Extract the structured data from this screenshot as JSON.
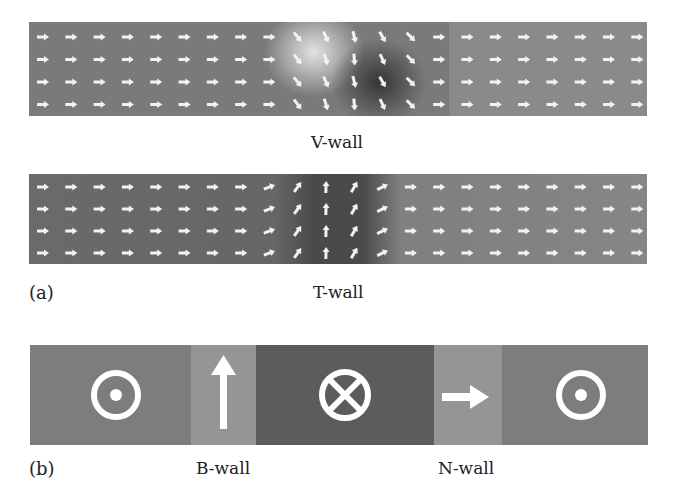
{
  "figure": {
    "panel_a": {
      "label": "(a)",
      "v_wall": {
        "caption": "V-wall",
        "background": "#7a7a7a",
        "rows": 4,
        "cols": 22
      },
      "t_wall": {
        "caption": "T-wall",
        "background": "#6c6c6c",
        "rows": 4,
        "cols": 22
      }
    },
    "panel_b": {
      "label": "(b)",
      "segments": [
        {
          "name": "domain-out",
          "symbol": "dot-circle",
          "color": "#7d7d7d"
        },
        {
          "name": "b-wall",
          "symbol": "arrow-up",
          "color": "#959595"
        },
        {
          "name": "domain-in",
          "symbol": "cross-circle",
          "color": "#5c5c5c"
        },
        {
          "name": "n-wall",
          "symbol": "arrow-right",
          "color": "#959595"
        },
        {
          "name": "domain-out-2",
          "symbol": "dot-circle",
          "color": "#7d7d7d"
        }
      ],
      "b_wall_caption": "B-wall",
      "n_wall_caption": "N-wall"
    }
  }
}
